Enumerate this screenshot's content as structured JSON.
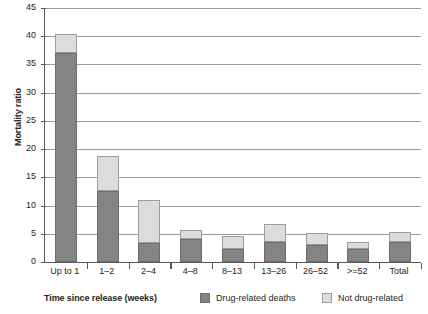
{
  "chart_data": {
    "type": "bar",
    "stacked": true,
    "title": "",
    "xlabel": "Time since release (weeks)",
    "ylabel": "Mortality ratio",
    "categories": [
      "Up to 1",
      "1–2",
      "2–4",
      "4–8",
      "8–13",
      "13–26",
      "26–52",
      ">=52",
      "Total"
    ],
    "series": [
      {
        "name": "Drug-related deaths",
        "color": "#848484",
        "values": [
          37.0,
          12.5,
          3.4,
          4.1,
          2.3,
          3.5,
          3.0,
          2.3,
          3.5
        ]
      },
      {
        "name": "Not drug-related",
        "color": "#dcdcdc",
        "values": [
          3.4,
          6.2,
          7.6,
          1.6,
          2.3,
          3.2,
          2.1,
          1.3,
          1.8
        ]
      }
    ],
    "totals": [
      40.4,
      18.7,
      11.0,
      5.7,
      4.6,
      6.7,
      5.1,
      3.6,
      5.3
    ],
    "ylim": [
      0,
      45
    ],
    "yticks": [
      0,
      5,
      10,
      15,
      20,
      25,
      30,
      35,
      40,
      45
    ],
    "ytick_labels": [
      "0",
      "5",
      "10",
      "15",
      "20",
      "25",
      "30",
      "35",
      "40",
      "45"
    ],
    "grid": true,
    "legend_position": "bottom"
  },
  "legend": {
    "entries": [
      {
        "label": "Drug-related deaths",
        "color": "#848484"
      },
      {
        "label": "Not drug-related",
        "color": "#dcdcdc"
      }
    ]
  },
  "colors": {
    "drug_related": "#848484",
    "not_drug_related": "#dcdcdc",
    "axis": "#58595b",
    "grid": "#9a9a9a",
    "text": "#231f20",
    "background": "#ffffff"
  }
}
